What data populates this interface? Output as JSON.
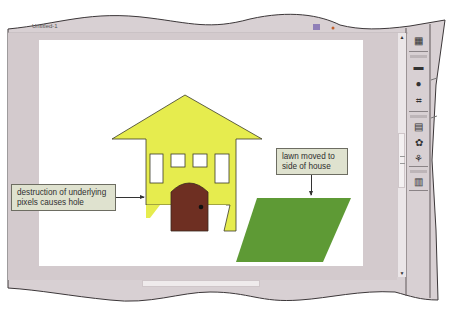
{
  "window": {
    "tab_title": "Untitled-1"
  },
  "document": {
    "callouts": [
      {
        "id": "hole",
        "text_line1": "destruction of underlying",
        "text_line2": "pixels causes hole"
      },
      {
        "id": "lawn",
        "text_line1": "lawn moved to",
        "text_line2": "side of house"
      }
    ],
    "objects": {
      "house": {
        "fill": "#e6ec4e",
        "outline": "#3a3a2a",
        "window_count": 4
      },
      "door": {
        "fill": "#6e2f22",
        "knob": "#111111"
      },
      "lawn": {
        "fill": "#5e9a35"
      }
    }
  },
  "panel_dock": {
    "icons": [
      {
        "name": "histogram-icon",
        "glyph": "▦"
      },
      {
        "name": "layer-comps-icon",
        "glyph": "▬"
      },
      {
        "name": "info-icon",
        "glyph": "●"
      },
      {
        "name": "transform-icon",
        "glyph": "⌗"
      },
      {
        "name": "tool-presets-icon",
        "glyph": "▤"
      },
      {
        "name": "channels-icon",
        "glyph": "✿"
      },
      {
        "name": "paths-icon",
        "glyph": "⚘"
      },
      {
        "name": "layers-icon",
        "glyph": "▥"
      }
    ]
  },
  "colors": {
    "frame_bg": "#d7cfd2",
    "workspace": "#cfc6c9",
    "accent_purple": "#8f7fb8"
  }
}
